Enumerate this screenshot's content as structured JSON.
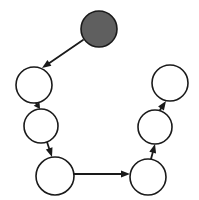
{
  "diagram": {
    "canvas": {
      "width": 199,
      "height": 200,
      "background": "#ffffff"
    },
    "style": {
      "node_stroke": "#1a1a1a",
      "node_stroke_width": 1.6,
      "node_empty_fill": "#ffffff",
      "node_filled_fill": "#5f5f5f",
      "edge_color": "#1a1a1a",
      "edge_width": 1.8,
      "arrowhead_length": 9,
      "arrowhead_width": 7
    },
    "nodes": [
      {
        "id": "n1",
        "name": "start-node-filled",
        "cx": 99,
        "cy": 29,
        "r": 18,
        "fill": "#5f5f5f",
        "state": "filled",
        "label": ""
      },
      {
        "id": "n2",
        "name": "node-upper-left",
        "cx": 34,
        "cy": 85,
        "r": 18,
        "fill": "#ffffff",
        "state": "empty",
        "label": ""
      },
      {
        "id": "n3",
        "name": "node-middle-left",
        "cx": 41,
        "cy": 126,
        "r": 17,
        "fill": "#ffffff",
        "state": "empty",
        "label": ""
      },
      {
        "id": "n4",
        "name": "node-lower-left",
        "cx": 55,
        "cy": 176,
        "r": 19,
        "fill": "#ffffff",
        "state": "empty",
        "label": ""
      },
      {
        "id": "n5",
        "name": "node-lower-right",
        "cx": 148,
        "cy": 177,
        "r": 18,
        "fill": "#ffffff",
        "state": "empty",
        "label": ""
      },
      {
        "id": "n6",
        "name": "node-middle-right",
        "cx": 155,
        "cy": 127,
        "r": 17,
        "fill": "#ffffff",
        "state": "empty",
        "label": ""
      },
      {
        "id": "n7",
        "name": "node-upper-right",
        "cx": 170,
        "cy": 83,
        "r": 18,
        "fill": "#ffffff",
        "state": "empty",
        "label": ""
      }
    ],
    "edges": [
      {
        "id": "e1",
        "name": "edge-start-to-upper-left",
        "from": "n1",
        "to": "n2",
        "x1": 83,
        "y1": 40,
        "x2": 42,
        "y2": 68,
        "label": ""
      },
      {
        "id": "e2",
        "name": "edge-upper-left-to-middle-left",
        "from": "n2",
        "to": "n3",
        "x1": 36,
        "y1": 103,
        "x2": 40,
        "y2": 109,
        "label": ""
      },
      {
        "id": "e3",
        "name": "edge-middle-left-to-lower-left",
        "from": "n3",
        "to": "n4",
        "x1": 47,
        "y1": 142,
        "x2": 52,
        "y2": 157,
        "label": ""
      },
      {
        "id": "e4",
        "name": "edge-lower-left-to-lower-right",
        "from": "n4",
        "to": "n5",
        "x1": 74,
        "y1": 174,
        "x2": 130,
        "y2": 174,
        "label": ""
      },
      {
        "id": "e5",
        "name": "edge-lower-right-to-middle-right",
        "from": "n5",
        "to": "n6",
        "x1": 151,
        "y1": 159,
        "x2": 155,
        "y2": 144,
        "label": ""
      },
      {
        "id": "e6",
        "name": "edge-middle-right-to-upper-right",
        "from": "n6",
        "to": "n7",
        "x1": 160,
        "y1": 110,
        "x2": 166,
        "y2": 101,
        "label": ""
      }
    ]
  }
}
